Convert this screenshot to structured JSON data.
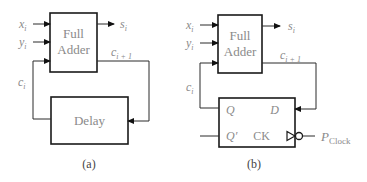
{
  "diagram_a": {
    "caption": "(a)",
    "adder_label_line1": "Full",
    "adder_label_line2": "Adder",
    "delay_label": "Delay",
    "inputs": {
      "x": "x",
      "y": "y",
      "sub": "i"
    },
    "output": {
      "s": "s",
      "sub": "i"
    },
    "carry_out": {
      "c": "c",
      "sub": "i + 1"
    },
    "carry_in": {
      "c": "c",
      "sub": "i"
    }
  },
  "diagram_b": {
    "caption": "(b)",
    "adder_label_line1": "Full",
    "adder_label_line2": "Adder",
    "inputs": {
      "x": "x",
      "y": "y",
      "sub": "i"
    },
    "output": {
      "s": "s",
      "sub": "i"
    },
    "carry_out": {
      "c": "c",
      "sub": "i + 1"
    },
    "carry_in": {
      "c": "c",
      "sub": "i"
    },
    "flipflop": {
      "q": "Q",
      "q_bar": "Q′",
      "d": "D",
      "ck": "CK"
    },
    "clock": {
      "p": "P",
      "sub": "Clock"
    }
  }
}
